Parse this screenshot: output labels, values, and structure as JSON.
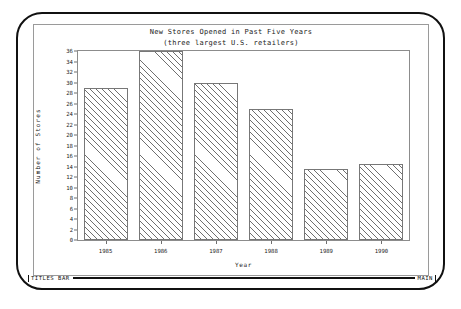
{
  "app": {
    "status_bar": {
      "left_label": "TITLES BAR",
      "right_label": "MAIN"
    }
  },
  "chart_data": {
    "type": "bar",
    "title": "New Stores Opened in Past Five Years",
    "subtitle": "(three largest U.S. retailers)",
    "xlabel": "Year",
    "ylabel": "Number of Stores",
    "categories": [
      "1985",
      "1986",
      "1987",
      "1988",
      "1989",
      "1990"
    ],
    "values": [
      29,
      36,
      30,
      25,
      13.5,
      14.5
    ],
    "ylim": [
      0,
      36
    ],
    "ytick_step": 2,
    "yticks": [
      "36",
      "34",
      "32",
      "30",
      "28",
      "26",
      "24",
      "22",
      "20",
      "18",
      "16",
      "14",
      "12",
      "10",
      "8",
      "6",
      "4",
      "2",
      "0"
    ],
    "grid": false,
    "legend": "none",
    "fill": "diagonal-hatch"
  }
}
